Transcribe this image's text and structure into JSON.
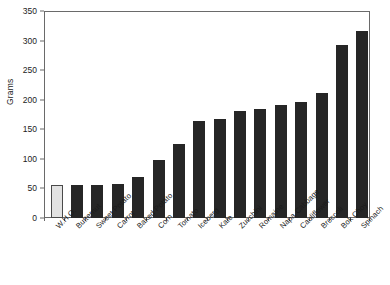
{
  "chart_data": {
    "type": "bar",
    "title": "",
    "xlabel": "",
    "ylabel": "Grams",
    "ylim": [
      0,
      350
    ],
    "ytick_step": 50,
    "yticks": [
      0,
      50,
      100,
      150,
      200,
      250,
      300,
      350
    ],
    "grid": false,
    "legend": "none",
    "categories": [
      "W.H.O.",
      "Butternut",
      "Sweet Potato",
      "Carrot",
      "Baked Potato",
      "Corn",
      "Tomato",
      "Iceberg",
      "Kale",
      "Zucchini",
      "Romaine",
      "Napa Cabbage",
      "Cauliflower",
      "Broccoli",
      "Bok Choy",
      "Spinach"
    ],
    "values": [
      56,
      56,
      56,
      57,
      69,
      98,
      125,
      164,
      168,
      181,
      184,
      191,
      196,
      211,
      293,
      316
    ],
    "highlight_index": 0,
    "colors": {
      "bar": "#262626",
      "highlight_bar": "#e2e2e2",
      "highlight_border": "#4a4a4a",
      "axis": "#6a6a6a",
      "text": "#1a1a1a",
      "background": "#ffffff"
    }
  }
}
